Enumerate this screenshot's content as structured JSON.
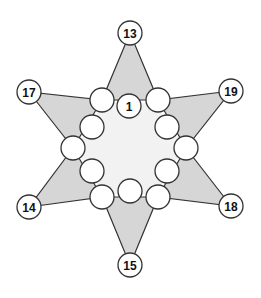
{
  "diagram": {
    "type": "six-pointed star number puzzle",
    "colors": {
      "background": "#ffffff",
      "arm_fill": "#d6d6d6",
      "center_fill": "#f2f2f2",
      "stroke": "#333333",
      "circle_fill": "#ffffff"
    },
    "outer_points": [
      {
        "id": "top",
        "label": "13",
        "x": 130,
        "y": 33
      },
      {
        "id": "upper-left",
        "label": "17",
        "x": 29,
        "y": 92
      },
      {
        "id": "upper-right",
        "label": "19",
        "x": 231,
        "y": 91
      },
      {
        "id": "lower-left",
        "label": "14",
        "x": 29,
        "y": 207
      },
      {
        "id": "lower-right",
        "label": "18",
        "x": 231,
        "y": 206
      },
      {
        "id": "bottom",
        "label": "15",
        "x": 130,
        "y": 265
      }
    ],
    "inner_ring": [
      {
        "id": "i1",
        "label": "",
        "x": 102,
        "y": 100
      },
      {
        "id": "i2",
        "label": "1",
        "x": 129,
        "y": 106
      },
      {
        "id": "i3",
        "label": "",
        "x": 158,
        "y": 100
      },
      {
        "id": "i4",
        "label": "",
        "x": 167,
        "y": 127
      },
      {
        "id": "i5",
        "label": "",
        "x": 186,
        "y": 148
      },
      {
        "id": "i6",
        "label": "",
        "x": 167,
        "y": 171
      },
      {
        "id": "i7",
        "label": "",
        "x": 158,
        "y": 197
      },
      {
        "id": "i8",
        "label": "",
        "x": 130,
        "y": 191
      },
      {
        "id": "i9",
        "label": "",
        "x": 102,
        "y": 197
      },
      {
        "id": "i10",
        "label": "",
        "x": 92,
        "y": 171
      },
      {
        "id": "i11",
        "label": "",
        "x": 73,
        "y": 148
      },
      {
        "id": "i12",
        "label": "",
        "x": 92,
        "y": 127
      }
    ]
  }
}
